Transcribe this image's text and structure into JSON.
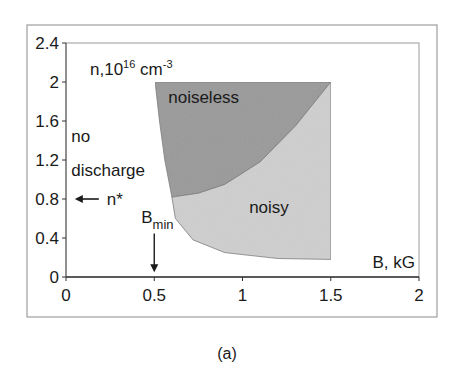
{
  "caption": "(a)",
  "chart_data": {
    "type": "area",
    "title": "",
    "xlabel": "B, kG",
    "ylabel": "n,10^16 cm^-3",
    "ylabel_parts": {
      "base": "n,10",
      "exp": "16",
      "unit": " cm",
      "unit_exp": "-3"
    },
    "xlim": [
      0,
      2
    ],
    "ylim": [
      0,
      2.4
    ],
    "x_ticks": [
      "0",
      "0.5",
      "1",
      "1.5",
      "2"
    ],
    "y_ticks": [
      "0",
      "0.4",
      "0.8",
      "1.2",
      "1.6",
      "2",
      "2.4"
    ],
    "grid": false,
    "legend": "none",
    "regions": [
      {
        "name": "noiseless",
        "color": "#9a9a9a",
        "boundary": [
          [
            0.505,
            2.0
          ],
          [
            1.5,
            2.0
          ],
          [
            1.3,
            1.55
          ],
          [
            1.1,
            1.18
          ],
          [
            0.9,
            0.95
          ],
          [
            0.75,
            0.86
          ],
          [
            0.6,
            0.82
          ],
          [
            0.56,
            1.2
          ],
          [
            0.53,
            1.6
          ],
          [
            0.505,
            2.0
          ]
        ]
      },
      {
        "name": "noisy",
        "color": "#cfcfcf",
        "boundary": [
          [
            0.6,
            0.82
          ],
          [
            0.75,
            0.86
          ],
          [
            0.9,
            0.95
          ],
          [
            1.1,
            1.18
          ],
          [
            1.3,
            1.55
          ],
          [
            1.5,
            2.0
          ],
          [
            1.5,
            0.18
          ],
          [
            1.2,
            0.19
          ],
          [
            0.9,
            0.25
          ],
          [
            0.72,
            0.38
          ],
          [
            0.62,
            0.6
          ],
          [
            0.6,
            0.82
          ]
        ]
      }
    ],
    "annotations": [
      {
        "text": "noiseless",
        "x": 0.78,
        "y": 1.85
      },
      {
        "text": "noisy",
        "x": 1.15,
        "y": 0.72
      },
      {
        "text": "no",
        "x": 0.03,
        "y": 1.45
      },
      {
        "text": "discharge",
        "x": 0.03,
        "y": 1.1
      },
      {
        "text": "n*",
        "x": 0.22,
        "y": 0.8,
        "arrow": "left",
        "arrow_to_x": 0.05
      },
      {
        "text": "B",
        "subscript": "min",
        "x": 0.5,
        "y": 0.55,
        "arrow": "down",
        "arrow_to_y": 0.05
      }
    ]
  }
}
